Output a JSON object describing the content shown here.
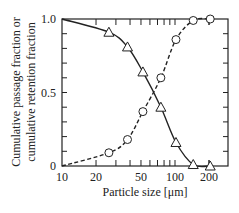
{
  "chart_data": {
    "type": "line",
    "title": "",
    "xlabel": "Particle size  [μm]",
    "ylabel": [
      "Cumulative passage fraction or",
      "cumulative retention fraction"
    ],
    "xscale": "log",
    "xlim": [
      10,
      300
    ],
    "ylim": [
      0,
      1.0
    ],
    "xticks": [
      10,
      20,
      50,
      100,
      200
    ],
    "xtick_labels": [
      "10",
      "20",
      "50",
      "100",
      "200"
    ],
    "yticks": [
      0,
      0.5,
      1.0
    ],
    "ytick_labels": [
      "0",
      "0.5",
      "1.0"
    ],
    "grid": false,
    "legend": null,
    "series": [
      {
        "name": "cumulative passage fraction",
        "marker": "circle",
        "line": "dashed",
        "x": [
          26,
          38,
          52,
          75,
          102,
          145,
          205
        ],
        "y": [
          0.09,
          0.18,
          0.37,
          0.6,
          0.86,
          0.99,
          1.0
        ]
      },
      {
        "name": "cumulative retention fraction",
        "marker": "triangle",
        "line": "solid",
        "x": [
          26,
          38,
          52,
          75,
          102,
          145,
          205
        ],
        "y": [
          0.91,
          0.81,
          0.64,
          0.4,
          0.16,
          0.01,
          0.0
        ]
      }
    ]
  }
}
